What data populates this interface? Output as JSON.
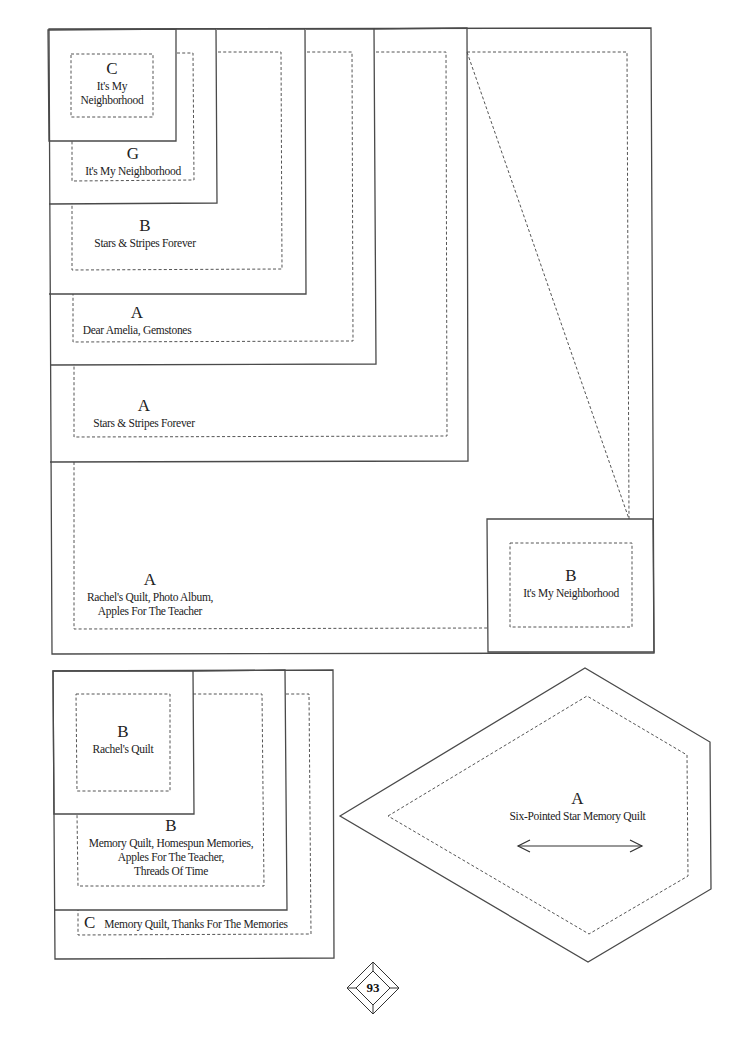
{
  "page": {
    "number": "93",
    "line_color": "#4a4a4a",
    "background": "#ffffff"
  },
  "top_stack": {
    "pieces": [
      {
        "letter": "C",
        "names": [
          "It's My",
          "Neighborhood"
        ]
      },
      {
        "letter": "G",
        "names": [
          "It's My Neighborhood"
        ]
      },
      {
        "letter": "B",
        "names": [
          "Stars & Stripes Forever"
        ]
      },
      {
        "letter": "A",
        "names": [
          "Dear Amelia, Gemstones"
        ]
      },
      {
        "letter": "A",
        "names": [
          "Stars & Stripes Forever"
        ]
      },
      {
        "letter": "A",
        "names": [
          "Rachel's Quilt, Photo Album,",
          "Apples For The Teacher"
        ]
      }
    ],
    "corner_piece": {
      "letter": "B",
      "names": [
        "It's My Neighborhood"
      ]
    }
  },
  "bottom_stack": {
    "pieces": [
      {
        "letter": "B",
        "names": [
          "Rachel's Quilt"
        ]
      },
      {
        "letter": "B",
        "names": [
          "Memory Quilt, Homespun Memories,",
          "Apples For The Teacher,",
          "Threads Of Time"
        ]
      },
      {
        "letter": "C",
        "names": [
          "Memory Quilt, Thanks For The Memories"
        ]
      }
    ]
  },
  "diamond_piece": {
    "letter": "A",
    "names": [
      "Six-Pointed Star Memory Quilt"
    ],
    "grainline_arrow": "double-headed-horizontal"
  }
}
